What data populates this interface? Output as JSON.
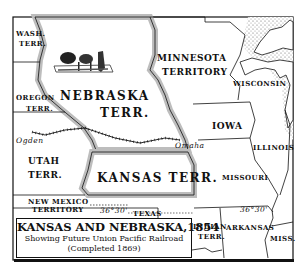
{
  "map": {
    "title": "KANSAS AND NEBRASKA,1854",
    "subtitle": "Showing Future Union Pacific Railroad",
    "completed": "(Completed 1869)",
    "regions": {
      "wash": [
        "WASH.",
        "TERR."
      ],
      "oregon": [
        "OREGON",
        "TERR."
      ],
      "nebraska": [
        "NEBRASKA",
        "TERR."
      ],
      "minnesota": [
        "MINNESOTA",
        "TERRITORY"
      ],
      "wisconsin": "WISCONSIN",
      "iowa": "IOWA",
      "illinois": "ILLINOIS",
      "utah": [
        "UTAH",
        "TERR."
      ],
      "kansas": "KANSAS TERR.",
      "missouri": "MISSOURI",
      "new_mexico": [
        "NEW MEXICO",
        "TERRITORY"
      ],
      "texas": "TEXAS",
      "indian": [
        "INDIAN",
        "TERR."
      ],
      "arkansas": "ARKANSAS",
      "miss": "MISS."
    },
    "cities": {
      "ogden": "Ogden",
      "omaha": "Omaha"
    },
    "parallel_label_1": "36°30'",
    "parallel_label_2": "36°30'",
    "colors": {
      "ink": "#111111",
      "shade": "#bdbdbd",
      "paper": "#ffffff"
    }
  }
}
